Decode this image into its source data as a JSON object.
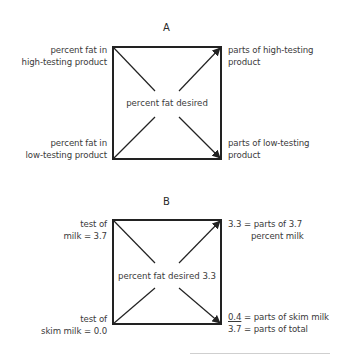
{
  "panel_a": {
    "heading": "A",
    "top_left": [
      "percent fat in",
      "high-testing product"
    ],
    "bottom_left": [
      "percent fat in",
      "low-testing product"
    ],
    "top_right": [
      "parts of high-testing",
      "product"
    ],
    "bottom_right": [
      "parts of low-testing",
      "product"
    ],
    "center": "percent fat desired"
  },
  "panel_b": {
    "heading": "B",
    "top_left": [
      "test of",
      "milk = 3.7"
    ],
    "bottom_left": [
      "test of",
      "skim milk = 0.0"
    ],
    "top_right": [
      "3.3 = parts of 3.7",
      "percent milk"
    ],
    "bottom_right": {
      "line1_value": "0.4",
      "line1_text": " = parts of skim milk",
      "line2_value": "3.7",
      "line2_text": " = parts of total"
    },
    "center": "percent fat desired 3.3"
  },
  "colors": {
    "line": "#222222",
    "text": "#3a3a3a"
  }
}
